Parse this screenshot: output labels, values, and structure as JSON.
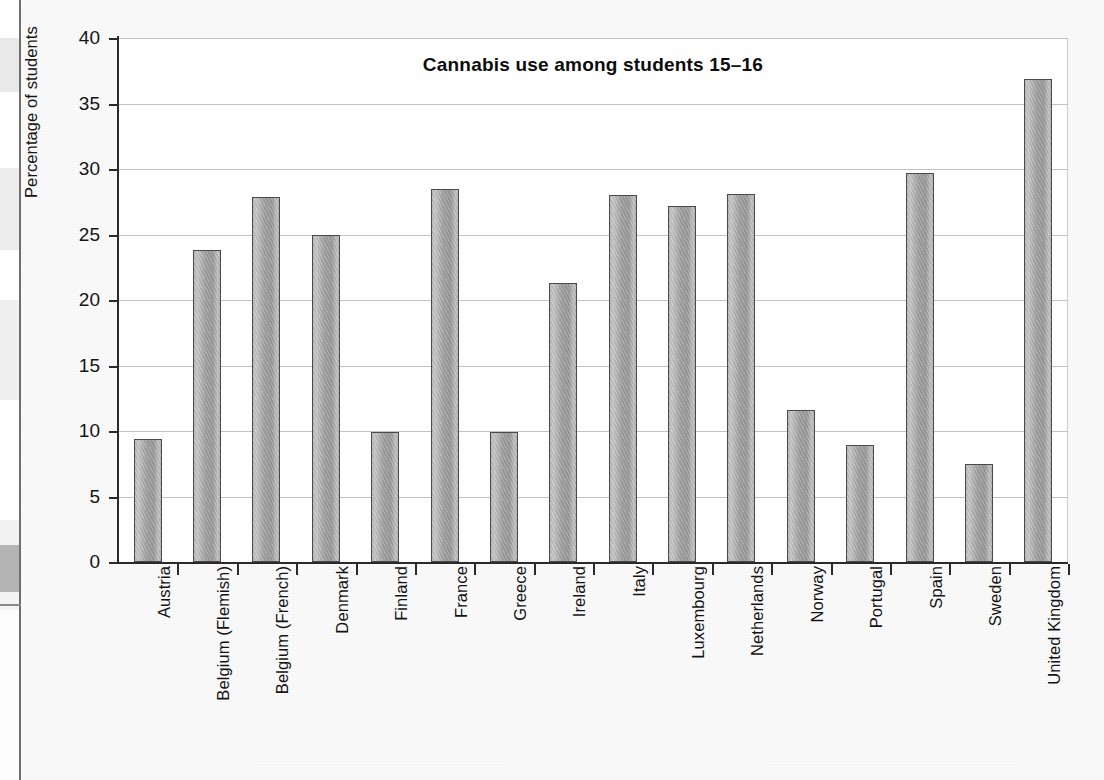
{
  "chart_data": {
    "type": "bar",
    "title": "Cannabis use among students 15–16",
    "xlabel": "",
    "ylabel": "Percentage of students",
    "ylim": [
      0,
      40
    ],
    "ytick_values": [
      0,
      5,
      10,
      15,
      20,
      25,
      30,
      35,
      40
    ],
    "ytick_labels": [
      "0",
      "5",
      "10",
      "15",
      "20",
      "25",
      "30",
      "35",
      "40"
    ],
    "grid": "horizontal",
    "legend": "none",
    "bar_color": "#a8a8a8",
    "bar_border_color": "#4a4a4a",
    "categories": [
      "Austria",
      "Belgium (Flemish)",
      "Belgium (French)",
      "Denmark",
      "Finland",
      "France",
      "Greece",
      "Ireland",
      "Italy",
      "Luxembourg",
      "Netherlands",
      "Norway",
      "Portugal",
      "Spain",
      "Sweden",
      "United Kingdom"
    ],
    "values": [
      9.4,
      23.8,
      27.9,
      25.0,
      9.9,
      28.5,
      9.9,
      21.3,
      28.0,
      27.2,
      28.1,
      11.6,
      8.9,
      29.7,
      7.5,
      36.9
    ]
  }
}
